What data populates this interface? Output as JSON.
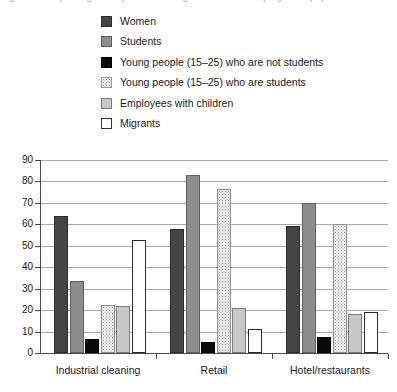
{
  "caption_remnant": "Figure: Groups targeted by collective agreements on employment (%)",
  "legend": {
    "position": "top",
    "items": [
      {
        "label": "Women",
        "key": "women",
        "swatch": "dark-gray-square-icon"
      },
      {
        "label": "Students",
        "key": "students",
        "swatch": "medium-gray-square-icon"
      },
      {
        "label": "Young people (15–25) who are not students",
        "key": "young_not_students",
        "swatch": "black-square-icon"
      },
      {
        "label": "Young people (15–25) who are students",
        "key": "young_students",
        "swatch": "dotted-square-icon"
      },
      {
        "label": "Employees with children",
        "key": "employees_with_children",
        "swatch": "light-gray-square-icon"
      },
      {
        "label": "Migrants",
        "key": "migrants",
        "swatch": "white-square-icon"
      }
    ]
  },
  "chart_data": {
    "type": "bar",
    "title": "",
    "xlabel": "",
    "ylabel": "",
    "ylim": [
      0,
      90
    ],
    "yticks": [
      0,
      10,
      20,
      30,
      40,
      50,
      60,
      70,
      80,
      90
    ],
    "ytick_labels": [
      "0",
      "10",
      "20",
      "30",
      "40",
      "50",
      "60",
      "70",
      "80",
      "90"
    ],
    "grid": true,
    "legend_position": "top",
    "categories": [
      "Industrial cleaning",
      "Retail",
      "Hotel/restaurants"
    ],
    "series": [
      {
        "name": "Women",
        "values": [
          64,
          58,
          59
        ]
      },
      {
        "name": "Students",
        "values": [
          33.5,
          83,
          70
        ]
      },
      {
        "name": "Young people (15–25) who are not students",
        "values": [
          6.5,
          5,
          7.5
        ]
      },
      {
        "name": "Young people (15–25) who are students",
        "values": [
          22.5,
          76.5,
          60
        ]
      },
      {
        "name": "Employees with children",
        "values": [
          22,
          21,
          18
        ]
      },
      {
        "name": "Migrants",
        "values": [
          52.5,
          11,
          19
        ]
      }
    ]
  },
  "colors": {
    "women": "#454545",
    "students": "#8d8d8d",
    "young_not_students": "#0a0a0a",
    "young_students": "#fbfbfb",
    "employees_with_children": "#c8c8c8",
    "migrants": "#ffffff",
    "grid": "#a9a9a9",
    "axis": "#4a4a4a"
  }
}
